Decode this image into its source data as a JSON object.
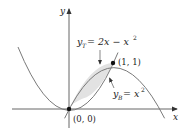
{
  "figure": {
    "axes": {
      "x_label": "x",
      "y_label": "y"
    },
    "curves": [
      {
        "name": "top",
        "label_var": "y",
        "label_sub": "T",
        "label_rhs": "= 2x − x",
        "label_exp": "2",
        "equation": "y_T = 2x - x^2"
      },
      {
        "name": "bottom",
        "label_var": "y",
        "label_sub": "B",
        "label_rhs": "= x",
        "label_exp": "2",
        "equation": "y_B = x^2"
      }
    ],
    "points": [
      {
        "label": "(0, 0)",
        "x": 0,
        "y": 0
      },
      {
        "label": "(1, 1)",
        "x": 1,
        "y": 1
      }
    ],
    "colors": {
      "curve": "#7a7a7a",
      "axis": "#555555",
      "fill": "#e2e2e2",
      "point": "#111111"
    }
  }
}
